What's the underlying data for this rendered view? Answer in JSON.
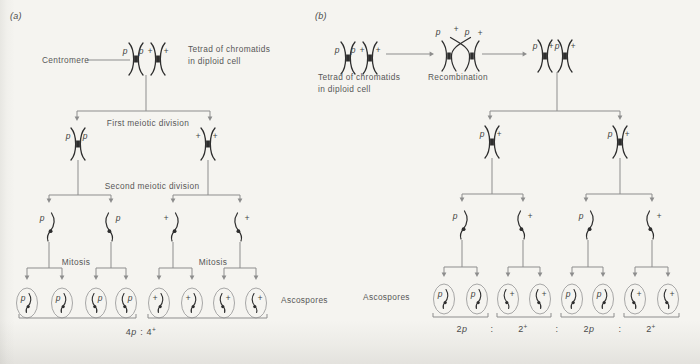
{
  "figure": {
    "panel_a": {
      "tag": "(a)",
      "centromere_label": "Centromere",
      "tetrad_caption": [
        "Tetrad of chromatids",
        "in diploid cell"
      ],
      "tetrad_alleles": [
        "p",
        "p",
        "+",
        "+"
      ],
      "first_division_label": "First meiotic division",
      "dyad_alleles": [
        "p",
        "p",
        "+",
        "+"
      ],
      "second_division_label": "Second meiotic division",
      "chromatid_alleles": [
        "p",
        "p",
        "+",
        "+"
      ],
      "mitosis_labels": [
        "Mitosis",
        "Mitosis"
      ],
      "ascospores_label": "Ascospores",
      "spore_alleles": [
        "p",
        "p",
        "p",
        "p",
        "+",
        "+",
        "+",
        "+"
      ],
      "ratio": [
        {
          "count": "4",
          "allele": "p"
        },
        {
          "sep": ":"
        },
        {
          "count": "4",
          "sup": "+"
        }
      ]
    },
    "panel_b": {
      "tag": "(b)",
      "tetrad_caption": [
        "Tetrad of chromatids",
        "in diploid cell"
      ],
      "tetrad_alleles": [
        "p",
        "p",
        "+",
        "+"
      ],
      "recombination_label": "Recombination",
      "recombination_alleles": [
        "p",
        "+",
        "p",
        "+"
      ],
      "recombined_tetrad_alleles": [
        "p",
        "+",
        "p",
        "+"
      ],
      "dyad_alleles": [
        "p",
        "+",
        "p",
        "+"
      ],
      "chromatid_alleles": [
        "p",
        "+",
        "p",
        "+"
      ],
      "ascospores_label": "Ascospores",
      "spore_alleles": [
        "p",
        "p",
        "+",
        "+",
        "p",
        "p",
        "+",
        "+"
      ],
      "ratio": [
        {
          "count": "2",
          "allele": "p"
        },
        {
          "sep": ":"
        },
        {
          "count": "2",
          "sup": "+"
        },
        {
          "sep": ":"
        },
        {
          "count": "2",
          "allele": "p"
        },
        {
          "sep": ":"
        },
        {
          "count": "2",
          "sup": "+"
        }
      ]
    }
  },
  "colors": {
    "bg": "#f5f4f0",
    "ink": "#2e2e2e",
    "line": "#8d8d8d",
    "oval": "#9e9e9e",
    "text": "#575757"
  }
}
